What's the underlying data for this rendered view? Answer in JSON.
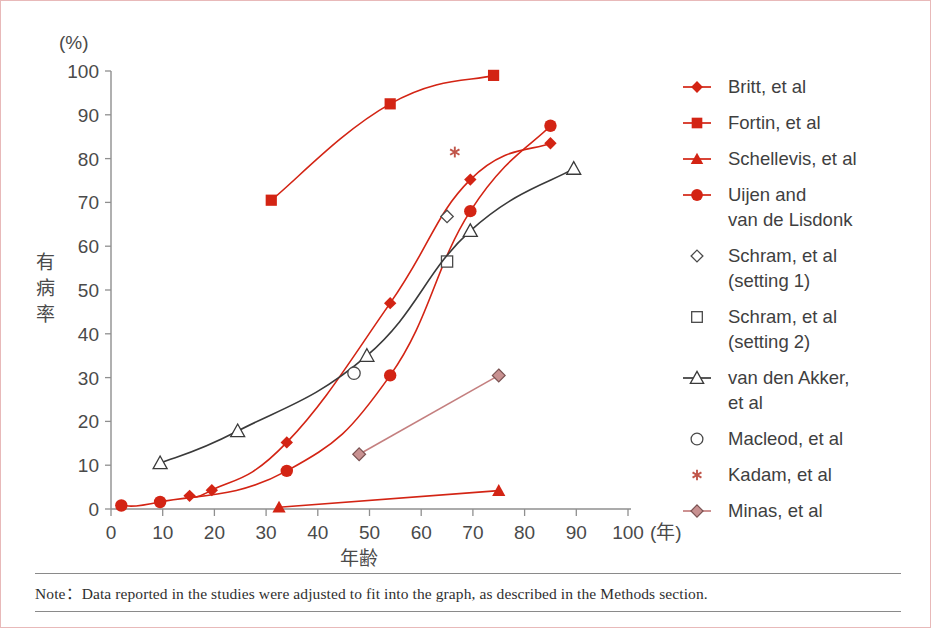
{
  "figure": {
    "note_prefix": "Note：",
    "note": "Note：Bata reported in the studies were adjusted to fit into the graph,  as described in the Methods section."
  },
  "note": {
    "text": "Note：Data reported in the studies were adjusted to fit into the graph,  as described in the Methods section."
  },
  "axes": {
    "y_unit": "(%)",
    "y_title": "有病率",
    "x_title": "年齢",
    "x_unit": "(年)",
    "y_ticks": [
      "0",
      "10",
      "20",
      "30",
      "40",
      "50",
      "60",
      "70",
      "80",
      "90",
      "100"
    ],
    "x_ticks": [
      "0",
      "10",
      "20",
      "30",
      "40",
      "50",
      "60",
      "70",
      "80",
      "90",
      "100"
    ]
  },
  "colors": {
    "red": "#d32414",
    "red_line": "#c0392b",
    "dark": "#3a3a3a",
    "minas": "#c47f7f",
    "minas_fill": "#c89191",
    "kadam": "#c0564a",
    "frame": "#e8b9b9",
    "text": "#4a4a4a"
  },
  "legend": [
    {
      "label": "Britt, et al",
      "marker": "diamond-filled",
      "line": true,
      "color": "#d32414",
      "lines": [
        "Britt, et al"
      ]
    },
    {
      "label": "Fortin, et al",
      "marker": "square-filled",
      "line": true,
      "color": "#d32414",
      "lines": [
        "Fortin, et al"
      ]
    },
    {
      "label": "Schellevis, et al",
      "marker": "triangle-filled",
      "line": true,
      "color": "#d32414",
      "lines": [
        "Schellevis, et al"
      ]
    },
    {
      "label": "Uijen and van de Lisdonk",
      "marker": "circle-filled",
      "line": true,
      "color": "#d32414",
      "lines": [
        "Uijen and",
        "van de Lisdonk"
      ]
    },
    {
      "label": "Schram, et al (setting 1)",
      "marker": "diamond-open",
      "line": false,
      "color": "#4a4a4a",
      "lines": [
        "Schram, et al",
        "(setting 1)"
      ]
    },
    {
      "label": "Schram, et al (setting 2)",
      "marker": "square-open",
      "line": false,
      "color": "#4a4a4a",
      "lines": [
        "Schram, et al",
        "(setting 2)"
      ]
    },
    {
      "label": "van den Akker, et al",
      "marker": "triangle-open",
      "line": true,
      "color": "#3a3a3a",
      "lines": [
        "van den Akker,",
        "et al"
      ]
    },
    {
      "label": "Macleod, et al",
      "marker": "circle-open",
      "line": false,
      "color": "#4a4a4a",
      "lines": [
        "Macleod, et al"
      ]
    },
    {
      "label": "Kadam, et al",
      "marker": "asterisk",
      "line": false,
      "color": "#c0564a",
      "lines": [
        "Kadam, et al"
      ]
    },
    {
      "label": "Minas, et al",
      "marker": "diamond-shaded",
      "line": true,
      "color": "#c47f7f",
      "lines": [
        "Minas, et al"
      ]
    }
  ],
  "chart_data": {
    "type": "line",
    "title": "",
    "xlabel": "年齢 (年)",
    "ylabel": "有病率 (%)",
    "xlim": [
      0,
      100
    ],
    "ylim": [
      0,
      100
    ],
    "grid": false,
    "legend_position": "right",
    "series": [
      {
        "name": "Britt, et al",
        "marker": "diamond-filled",
        "color": "#d32414",
        "connected": true,
        "points": [
          [
            15.2,
            3.0
          ],
          [
            19.5,
            4.3
          ],
          [
            34.0,
            15.2
          ],
          [
            54.0,
            47.0
          ],
          [
            69.5,
            75.2
          ],
          [
            85.0,
            83.5
          ]
        ]
      },
      {
        "name": "Fortin, et al",
        "marker": "square-filled",
        "color": "#d32414",
        "connected": true,
        "points": [
          [
            31.0,
            70.5
          ],
          [
            54.0,
            92.5
          ],
          [
            74.0,
            99.0
          ]
        ]
      },
      {
        "name": "Schellevis, et al",
        "marker": "triangle-filled",
        "color": "#d32414",
        "connected": true,
        "points": [
          [
            32.5,
            0.4
          ],
          [
            75.0,
            4.2
          ]
        ]
      },
      {
        "name": "Uijen and van de Lisdonk",
        "marker": "circle-filled",
        "color": "#d32414",
        "connected": true,
        "points": [
          [
            2.0,
            0.8
          ],
          [
            9.5,
            1.6
          ],
          [
            34.0,
            8.7
          ],
          [
            54.0,
            30.5
          ],
          [
            69.5,
            68.0
          ],
          [
            85.0,
            87.5
          ]
        ]
      },
      {
        "name": "Schram, et al (setting 1)",
        "marker": "diamond-open",
        "color": "#4a4a4a",
        "connected": false,
        "points": [
          [
            65.0,
            66.8
          ]
        ]
      },
      {
        "name": "Schram, et al (setting 2)",
        "marker": "square-open",
        "color": "#4a4a4a",
        "connected": false,
        "points": [
          [
            65.0,
            56.5
          ]
        ]
      },
      {
        "name": "van den Akker, et al",
        "marker": "triangle-open",
        "color": "#3a3a3a",
        "connected": true,
        "points": [
          [
            9.5,
            10.5
          ],
          [
            24.5,
            17.8
          ],
          [
            49.5,
            35.0
          ],
          [
            69.5,
            63.5
          ],
          [
            89.5,
            77.7
          ]
        ]
      },
      {
        "name": "Macleod, et al",
        "marker": "circle-open",
        "color": "#4a4a4a",
        "connected": false,
        "points": [
          [
            47.0,
            31.0
          ]
        ]
      },
      {
        "name": "Kadam, et al",
        "marker": "asterisk",
        "color": "#c0564a",
        "connected": false,
        "points": [
          [
            66.5,
            81.5
          ]
        ]
      },
      {
        "name": "Minas, et al",
        "marker": "diamond-shaded",
        "color": "#c47f7f",
        "connected": true,
        "points": [
          [
            48.0,
            12.5
          ],
          [
            75.0,
            30.5
          ]
        ]
      }
    ]
  }
}
